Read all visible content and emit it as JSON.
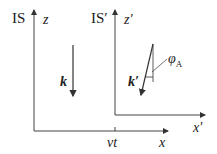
{
  "frames": {
    "rest": {
      "name": "IS",
      "axis_vertical": "z",
      "axis_horizontal": "x",
      "vector": "k"
    },
    "moving": {
      "name": "IS′",
      "axis_vertical": "z′",
      "axis_horizontal": "x′",
      "vector": "k′",
      "angle": "φ",
      "angle_sub": "A"
    }
  },
  "offset_label": "vt"
}
